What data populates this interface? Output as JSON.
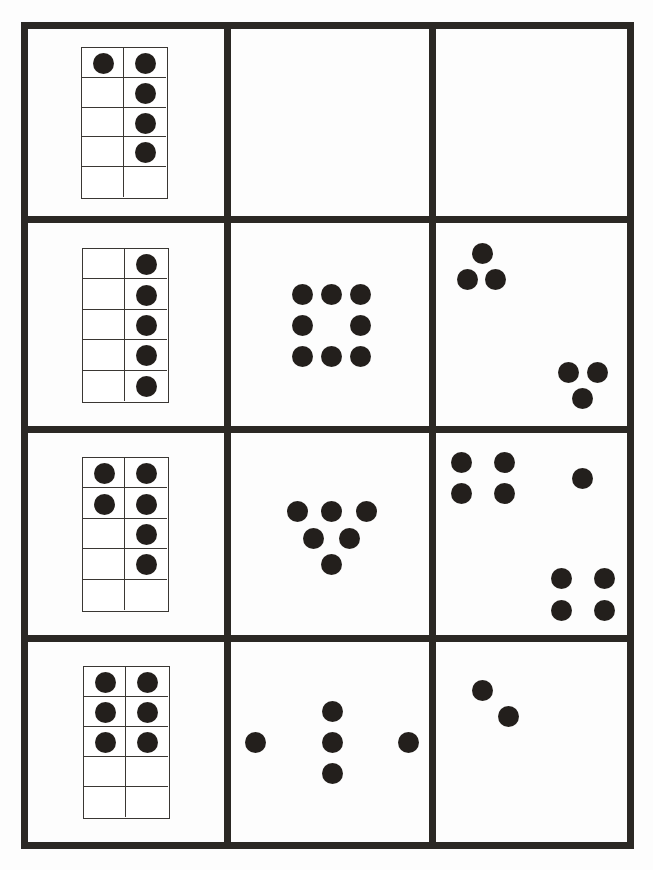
{
  "sheet": {
    "width": 653,
    "height": 870,
    "colors": {
      "line": "#2b2824",
      "dot": "#231f1c",
      "paper": "#fdfdfd"
    },
    "outer_box": {
      "left": 21,
      "top": 22,
      "right": 634,
      "bottom": 849,
      "thickness": 7
    },
    "vertical_lines_x": [
      227,
      432
    ],
    "horizontal_lines_y": [
      219,
      429,
      638
    ],
    "dot_diameter": 21
  },
  "rows": [
    {
      "ten_frame": {
        "x": 81,
        "y": 47,
        "w": 87,
        "h": 152,
        "filled": [
          [
            true,
            true
          ],
          [
            false,
            true
          ],
          [
            false,
            true
          ],
          [
            false,
            true
          ],
          [
            false,
            false
          ]
        ],
        "count": 5
      },
      "middle_cell": {
        "dots": [],
        "count": 0
      },
      "right_cell": {
        "dots": [],
        "count": 0
      }
    },
    {
      "ten_frame": {
        "x": 82,
        "y": 248,
        "w": 87,
        "h": 155,
        "filled": [
          [
            false,
            true
          ],
          [
            false,
            true
          ],
          [
            false,
            true
          ],
          [
            false,
            true
          ],
          [
            false,
            true
          ]
        ],
        "count": 5
      },
      "middle_cell": {
        "count": 8,
        "pattern": "square-ring",
        "dots": [
          [
            302,
            294
          ],
          [
            331,
            294
          ],
          [
            360,
            294
          ],
          [
            302,
            325
          ],
          [
            360,
            325
          ],
          [
            302,
            356
          ],
          [
            331,
            356
          ],
          [
            360,
            356
          ]
        ]
      },
      "right_cell": {
        "count": 6,
        "pattern": "two-triangles",
        "dots": [
          [
            482,
            253
          ],
          [
            467,
            279
          ],
          [
            495,
            279
          ],
          [
            568,
            372
          ],
          [
            597,
            372
          ],
          [
            582,
            398
          ]
        ]
      }
    },
    {
      "ten_frame": {
        "x": 82,
        "y": 457,
        "w": 87,
        "h": 155,
        "filled": [
          [
            true,
            true
          ],
          [
            true,
            true
          ],
          [
            false,
            true
          ],
          [
            false,
            true
          ],
          [
            false,
            false
          ]
        ],
        "count": 6
      },
      "middle_cell": {
        "count": 6,
        "pattern": "inverted-triangle",
        "dots": [
          [
            297,
            511
          ],
          [
            331,
            511
          ],
          [
            366,
            511
          ],
          [
            313,
            538
          ],
          [
            349,
            538
          ],
          [
            331,
            564
          ]
        ]
      },
      "right_cell": {
        "count": 9,
        "pattern": "two-squares-plus-one",
        "dots": [
          [
            461,
            462
          ],
          [
            504,
            462
          ],
          [
            461,
            493
          ],
          [
            504,
            493
          ],
          [
            582,
            478
          ],
          [
            561,
            578
          ],
          [
            604,
            578
          ],
          [
            561,
            610
          ],
          [
            604,
            610
          ]
        ]
      }
    },
    {
      "ten_frame": {
        "x": 83,
        "y": 666,
        "w": 87,
        "h": 153,
        "filled": [
          [
            true,
            true
          ],
          [
            true,
            true
          ],
          [
            true,
            true
          ],
          [
            false,
            false
          ],
          [
            false,
            false
          ]
        ],
        "count": 6
      },
      "middle_cell": {
        "count": 5,
        "pattern": "cross",
        "dots": [
          [
            255,
            742
          ],
          [
            332,
            711
          ],
          [
            332,
            742
          ],
          [
            332,
            773
          ],
          [
            408,
            742
          ]
        ]
      },
      "right_cell": {
        "count": 2,
        "pattern": "diagonal-pair",
        "dots": [
          [
            482,
            690
          ],
          [
            508,
            716
          ]
        ]
      }
    }
  ]
}
